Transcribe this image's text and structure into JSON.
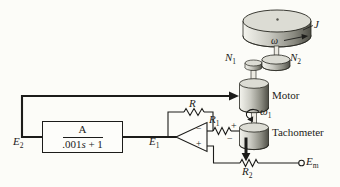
{
  "colors": {
    "ink": "#1c1c1a",
    "paper": "#fcfcf8",
    "metal_light": "#f4f4ee",
    "metal_dark": "#4e4e46"
  },
  "block": {
    "numerator": "A",
    "denominator_pre": ".001",
    "denominator_var": "s",
    "denominator_post": " + 1"
  },
  "labels": {
    "e2": {
      "base": "E",
      "sub": "2"
    },
    "e1": {
      "base": "E",
      "sub": "1"
    },
    "em": {
      "base": "E",
      "sub": "m"
    },
    "feedback_resistor": "R",
    "r1": {
      "base": "R",
      "sub": "1"
    },
    "r2": {
      "base": "R",
      "sub": "2"
    },
    "n1": {
      "base": "N",
      "sub": "1"
    },
    "n2": {
      "base": "N",
      "sub": "2"
    },
    "inertia": "J",
    "omega": "ω",
    "omega1": {
      "base": "ω",
      "sub": "1"
    },
    "motor": "Motor",
    "tachometer": "Tachometer",
    "tach_plus": "+",
    "tach_minus": "−",
    "opamp_minus": "−",
    "opamp_plus": "+"
  }
}
